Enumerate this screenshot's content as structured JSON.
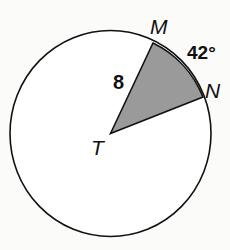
{
  "diagram": {
    "type": "circle-sector",
    "center_label": "T",
    "point_labels": {
      "m": "M",
      "n": "N"
    },
    "radius_label": "8",
    "arc_label": "42°",
    "colors": {
      "stroke": "#111111",
      "sector_fill": "#9a9a9a",
      "circle_fill": "#ffffff"
    }
  }
}
